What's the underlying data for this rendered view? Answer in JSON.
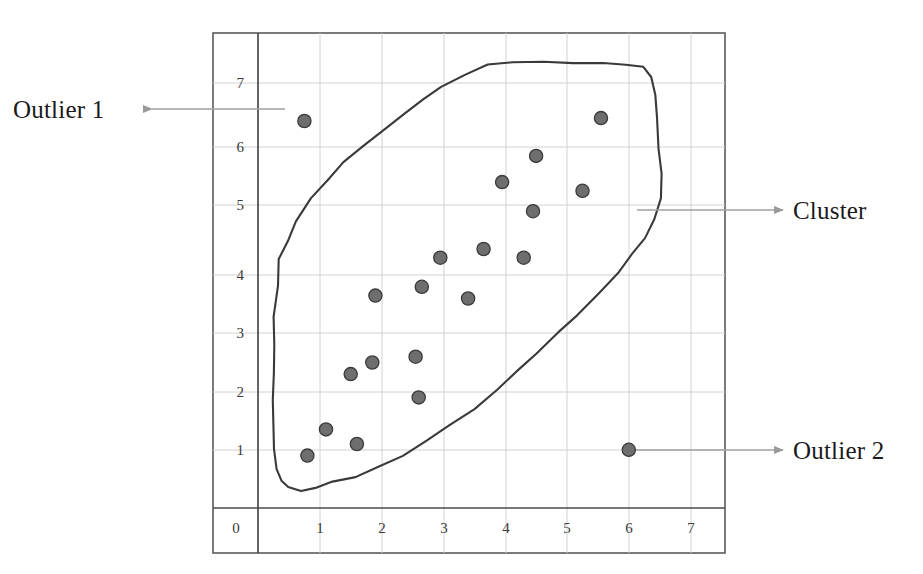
{
  "figure": {
    "kind": "scatter-plot-scan",
    "background": "#ffffff",
    "frame_color": "#555555",
    "grid_color": "#cfcfcf",
    "axis_color": "#444444",
    "point_fill": "#6e6e6e",
    "point_stroke": "#3b3b3b",
    "outline_color": "#3a3a3a",
    "arrow_color": "#9a9a9a",
    "text_color": "#1a1a1a",
    "top_cut_text": "scan of figure caption (clipped)"
  },
  "annotations": [
    {
      "id": "outlier-1",
      "label": "Outlier 1",
      "direction": "left",
      "target_point": [
        0.75,
        6.65
      ]
    },
    {
      "id": "cluster",
      "label": "Cluster",
      "direction": "right",
      "target_point": [
        6.45,
        5.05
      ]
    },
    {
      "id": "outlier-2",
      "label": "Outlier 2",
      "direction": "right",
      "target_point": [
        6.0,
        1.0
      ]
    }
  ],
  "chart_data": {
    "type": "scatter",
    "title": "",
    "xlabel": "",
    "ylabel": "",
    "xlim": [
      0,
      7.6
    ],
    "ylim": [
      0,
      7.6
    ],
    "xticks": [
      0,
      1,
      2,
      3,
      4,
      5,
      6,
      7
    ],
    "yticks": [
      1,
      2,
      3,
      4,
      5,
      6,
      7
    ],
    "grid": true,
    "legend": "none",
    "series": [
      {
        "name": "Cluster",
        "note": "dense elongated group enclosed by hand-drawn contour",
        "points": [
          [
            0.8,
            0.9
          ],
          [
            1.1,
            1.35
          ],
          [
            1.6,
            1.1
          ],
          [
            1.5,
            2.3
          ],
          [
            1.85,
            2.5
          ],
          [
            2.6,
            1.9
          ],
          [
            2.55,
            2.6
          ],
          [
            1.9,
            3.65
          ],
          [
            2.65,
            3.8
          ],
          [
            3.4,
            3.6
          ],
          [
            2.95,
            4.3
          ],
          [
            3.65,
            4.45
          ],
          [
            4.3,
            4.3
          ],
          [
            4.45,
            5.1
          ],
          [
            3.95,
            5.6
          ],
          [
            4.5,
            6.05
          ],
          [
            5.25,
            5.45
          ],
          [
            5.55,
            6.7
          ]
        ]
      },
      {
        "name": "Outliers",
        "note": "isolated points far from the cluster contour",
        "points": [
          [
            0.75,
            6.65
          ],
          [
            6.0,
            1.0
          ]
        ]
      }
    ],
    "contour": {
      "name": "cluster-boundary",
      "closed": true,
      "vertices": [
        [
          0.28,
          3.3
        ],
        [
          0.3,
          3.8
        ],
        [
          0.36,
          4.25
        ],
        [
          0.48,
          4.6
        ],
        [
          0.62,
          4.92
        ],
        [
          0.86,
          5.3
        ],
        [
          1.12,
          5.62
        ],
        [
          1.4,
          5.92
        ],
        [
          1.72,
          6.22
        ],
        [
          2.04,
          6.5
        ],
        [
          2.36,
          6.78
        ],
        [
          2.66,
          7.02
        ],
        [
          2.98,
          7.26
        ],
        [
          3.32,
          7.46
        ],
        [
          3.7,
          7.6
        ],
        [
          4.12,
          7.66
        ],
        [
          4.6,
          7.68
        ],
        [
          5.1,
          7.66
        ],
        [
          5.58,
          7.66
        ],
        [
          5.96,
          7.64
        ],
        [
          6.22,
          7.56
        ],
        [
          6.36,
          7.38
        ],
        [
          6.42,
          7.1
        ],
        [
          6.46,
          6.7
        ],
        [
          6.5,
          6.2
        ],
        [
          6.54,
          5.72
        ],
        [
          6.52,
          5.3
        ],
        [
          6.44,
          4.96
        ],
        [
          6.28,
          4.66
        ],
        [
          6.06,
          4.36
        ],
        [
          5.8,
          4.04
        ],
        [
          5.5,
          3.7
        ],
        [
          5.18,
          3.34
        ],
        [
          4.86,
          3.0
        ],
        [
          4.52,
          2.66
        ],
        [
          4.18,
          2.32
        ],
        [
          3.84,
          2.0
        ],
        [
          3.48,
          1.7
        ],
        [
          3.1,
          1.42
        ],
        [
          2.72,
          1.16
        ],
        [
          2.34,
          0.92
        ],
        [
          1.96,
          0.72
        ],
        [
          1.58,
          0.56
        ],
        [
          1.22,
          0.44
        ],
        [
          0.92,
          0.36
        ],
        [
          0.68,
          0.32
        ],
        [
          0.5,
          0.34
        ],
        [
          0.38,
          0.44
        ],
        [
          0.32,
          0.68
        ],
        [
          0.28,
          1.0
        ],
        [
          0.26,
          1.42
        ],
        [
          0.26,
          1.88
        ],
        [
          0.24,
          2.32
        ],
        [
          0.26,
          2.8
        ]
      ]
    }
  }
}
